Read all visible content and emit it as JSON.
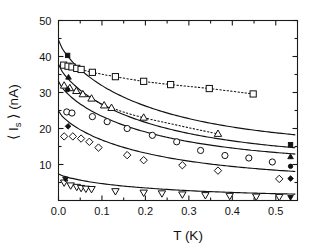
{
  "chart_data": {
    "type": "scatter",
    "title": "",
    "xlabel": "T (K)",
    "ylabel": "⟨ I",
    "ylabel_sub": "s",
    "ylabel_tail": " ⟩ (nA)",
    "xlim": [
      0.0,
      0.55
    ],
    "ylim": [
      0.0,
      50.0
    ],
    "xticks": [
      0.0,
      0.1,
      0.2,
      0.3,
      0.4,
      0.5
    ],
    "xticklabels": [
      "0.0",
      "0.1",
      "0.2",
      "0.3",
      "0.4",
      "0.5"
    ],
    "yticks": [
      10,
      20,
      30,
      40,
      50
    ],
    "yticklabels": [
      "10",
      "20",
      "30",
      "40",
      "50"
    ],
    "grid": false,
    "legend": "none",
    "series": [
      {
        "name": "open-squares-dotted",
        "marker": "square",
        "fill": "open",
        "line": "dotted",
        "points": [
          {
            "x": 0.012,
            "y": 37.6
          },
          {
            "x": 0.022,
            "y": 37.3
          },
          {
            "x": 0.031,
            "y": 37.1
          },
          {
            "x": 0.042,
            "y": 36.7
          },
          {
            "x": 0.052,
            "y": 36.4
          },
          {
            "x": 0.078,
            "y": 35.6
          },
          {
            "x": 0.131,
            "y": 34.4
          },
          {
            "x": 0.196,
            "y": 33.1
          },
          {
            "x": 0.258,
            "y": 32.2
          },
          {
            "x": 0.347,
            "y": 31.1
          },
          {
            "x": 0.448,
            "y": 29.6
          }
        ]
      },
      {
        "name": "filled-squares-solid",
        "marker": "square",
        "fill": "filled",
        "line": "solid",
        "fit_y0": 44.6,
        "points": [
          {
            "x": 0.021,
            "y": 40.3
          },
          {
            "x": 0.534,
            "y": 15.5
          }
        ]
      },
      {
        "name": "open-triangles-dotted",
        "marker": "triangle-up",
        "fill": "open",
        "line": "dotted",
        "points": [
          {
            "x": 0.013,
            "y": 31.9
          },
          {
            "x": 0.026,
            "y": 31.2
          },
          {
            "x": 0.041,
            "y": 30.4
          },
          {
            "x": 0.056,
            "y": 29.5
          },
          {
            "x": 0.076,
            "y": 28.3
          },
          {
            "x": 0.105,
            "y": 26.4
          },
          {
            "x": 0.122,
            "y": 25.7
          },
          {
            "x": 0.196,
            "y": 23.0
          },
          {
            "x": 0.367,
            "y": 18.5
          }
        ]
      },
      {
        "name": "filled-triangles-solid",
        "marker": "triangle-up",
        "fill": "filled",
        "line": "solid",
        "fit_y0": 37.9,
        "points": [
          {
            "x": 0.023,
            "y": 34.2
          },
          {
            "x": 0.534,
            "y": 12.1
          }
        ]
      },
      {
        "name": "open-circles-solid",
        "marker": "circle",
        "fill": "open",
        "line": "solid",
        "fit_y0": 33.1,
        "points": [
          {
            "x": 0.019,
            "y": 24.6
          },
          {
            "x": 0.031,
            "y": 24.3
          },
          {
            "x": 0.078,
            "y": 23.3
          },
          {
            "x": 0.112,
            "y": 21.9
          },
          {
            "x": 0.158,
            "y": 20.0
          },
          {
            "x": 0.216,
            "y": 18.1
          },
          {
            "x": 0.272,
            "y": 16.3
          },
          {
            "x": 0.327,
            "y": 13.9
          },
          {
            "x": 0.383,
            "y": 12.5
          },
          {
            "x": 0.438,
            "y": 11.8
          },
          {
            "x": 0.492,
            "y": 10.7
          }
        ]
      },
      {
        "name": "filled-circles-right",
        "marker": "circle",
        "fill": "filled",
        "line": "none",
        "points": [
          {
            "x": 0.021,
            "y": 30.8
          },
          {
            "x": 0.534,
            "y": 9.5
          }
        ]
      },
      {
        "name": "open-diamonds-solid",
        "marker": "diamond",
        "fill": "open",
        "line": "solid",
        "fit_y0": 24.9,
        "points": [
          {
            "x": 0.013,
            "y": 17.8
          },
          {
            "x": 0.033,
            "y": 17.8
          },
          {
            "x": 0.052,
            "y": 17.2
          },
          {
            "x": 0.071,
            "y": 16.3
          },
          {
            "x": 0.092,
            "y": 14.7
          },
          {
            "x": 0.158,
            "y": 12.6
          },
          {
            "x": 0.196,
            "y": 11.2
          },
          {
            "x": 0.285,
            "y": 9.8
          },
          {
            "x": 0.367,
            "y": 8.3
          },
          {
            "x": 0.508,
            "y": 6.0
          }
        ]
      },
      {
        "name": "filled-diamonds-right",
        "marker": "diamond",
        "fill": "filled",
        "line": "none",
        "points": [
          {
            "x": 0.022,
            "y": 20.6
          },
          {
            "x": 0.534,
            "y": 6.1
          }
        ]
      },
      {
        "name": "open-down-triangles-solid",
        "marker": "triangle-down",
        "fill": "open",
        "line": "solid",
        "fit_y0": 7.4,
        "points": [
          {
            "x": 0.013,
            "y": 5.0
          },
          {
            "x": 0.028,
            "y": 4.2
          },
          {
            "x": 0.042,
            "y": 3.8
          },
          {
            "x": 0.052,
            "y": 3.5
          },
          {
            "x": 0.063,
            "y": 3.3
          },
          {
            "x": 0.076,
            "y": 3.2
          },
          {
            "x": 0.131,
            "y": 2.6
          },
          {
            "x": 0.196,
            "y": 2.2
          },
          {
            "x": 0.238,
            "y": 2.0
          },
          {
            "x": 0.285,
            "y": 1.7
          },
          {
            "x": 0.338,
            "y": 1.5
          },
          {
            "x": 0.394,
            "y": 1.3
          },
          {
            "x": 0.455,
            "y": 1.1
          },
          {
            "x": 0.508,
            "y": 1.0
          }
        ]
      },
      {
        "name": "filled-down-triangles",
        "marker": "triangle-down",
        "fill": "filled",
        "line": "none",
        "points": [
          {
            "x": 0.016,
            "y": 6.0
          },
          {
            "x": 0.534,
            "y": 0.9
          }
        ]
      }
    ]
  }
}
